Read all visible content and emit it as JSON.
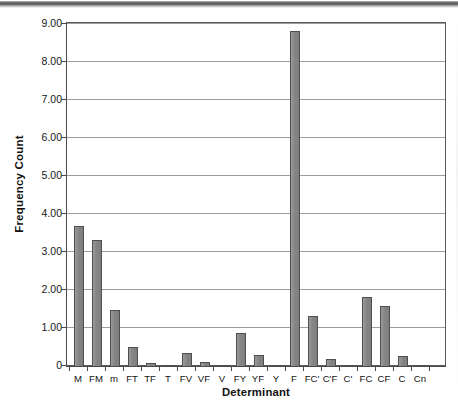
{
  "chart_data": {
    "type": "bar",
    "title": "",
    "xlabel": "Determinant",
    "ylabel": "Frequency Count",
    "ylim": [
      0,
      9
    ],
    "ytick_values": [
      0,
      1,
      2,
      3,
      4,
      5,
      6,
      7,
      8,
      9
    ],
    "ytick_labels": [
      "0",
      "1.00",
      "2.00",
      "3.00",
      "4.00",
      "5.00",
      "6.00",
      "7.00",
      "8.00",
      "9.00"
    ],
    "grid": "horizontal",
    "legend": "none",
    "bar_color": "#8c8c8c",
    "bar_edge_color": "#4f4f4f",
    "gridline_color": "#9d9d9d",
    "axis_color": "#4a4a4a",
    "categories": [
      "M",
      "FM",
      "m",
      "FT",
      "TF",
      "T",
      "FV",
      "VF",
      "V",
      "FY",
      "YF",
      "Y",
      "F",
      "FC'",
      "C'F",
      "C'",
      "FC",
      "CF",
      "C",
      "Cn"
    ],
    "values": [
      3.72,
      3.35,
      1.5,
      0.52,
      0.1,
      0.03,
      0.38,
      0.13,
      0.02,
      0.9,
      0.32,
      0.05,
      8.85,
      1.35,
      0.2,
      0.05,
      1.85,
      1.6,
      0.3,
      0.02
    ]
  },
  "scan": {
    "caption": ""
  }
}
